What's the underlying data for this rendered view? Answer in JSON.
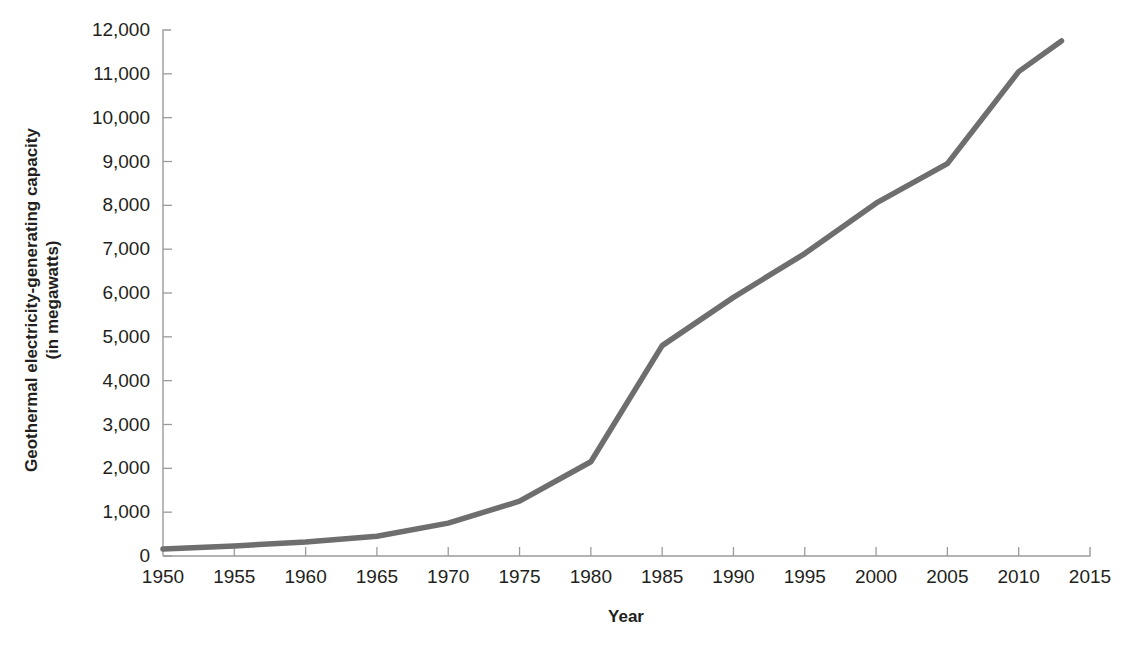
{
  "chart_data": {
    "type": "line",
    "title": "",
    "xlabel": "Year",
    "ylabel": "Geothermal electricity-generating capacity (in megawatts)",
    "ylabel_line1": "Geothermal electricity-generating capacity",
    "ylabel_line2": "(in megawatts)",
    "xlim": [
      1950,
      2015
    ],
    "ylim": [
      0,
      12000
    ],
    "grid": false,
    "legend": false,
    "legend_position": "none",
    "line_color": "#6e6e6e",
    "axis_color": "#9b9b9b",
    "x": [
      1950,
      1955,
      1960,
      1965,
      1970,
      1975,
      1980,
      1985,
      1990,
      1995,
      2000,
      2005,
      2010,
      2013
    ],
    "values": [
      160,
      230,
      320,
      450,
      750,
      1250,
      2150,
      4800,
      5900,
      6900,
      8050,
      8950,
      11050,
      11750
    ],
    "series": [
      {
        "name": "Geothermal electricity-generating capacity",
        "values": [
          160,
          230,
          320,
          450,
          750,
          1250,
          2150,
          4800,
          5900,
          6900,
          8050,
          8950,
          11050,
          11750
        ]
      }
    ],
    "xticks": [
      1950,
      1955,
      1960,
      1965,
      1970,
      1975,
      1980,
      1985,
      1990,
      1995,
      2000,
      2005,
      2010,
      2015
    ],
    "xtick_labels": [
      "1950",
      "1955",
      "1960",
      "1965",
      "1970",
      "1975",
      "1980",
      "1985",
      "1990",
      "1995",
      "2000",
      "2005",
      "2010",
      "2015"
    ],
    "yticks": [
      0,
      1000,
      2000,
      3000,
      4000,
      5000,
      6000,
      7000,
      8000,
      9000,
      10000,
      11000,
      12000
    ],
    "ytick_labels": [
      "0",
      "1,000",
      "2,000",
      "3,000",
      "4,000",
      "5,000",
      "6,000",
      "7,000",
      "8,000",
      "9,000",
      "10,000",
      "11,000",
      "12,000"
    ]
  }
}
